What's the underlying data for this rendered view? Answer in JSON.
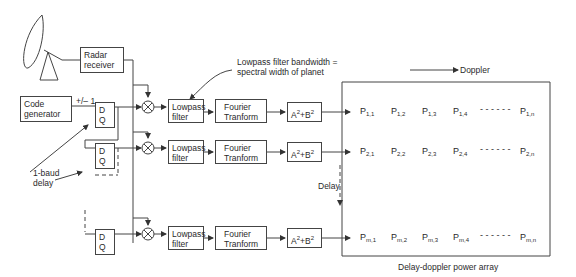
{
  "blocks": {
    "radar_receiver": "Radar receiver",
    "code_generator": "Code generator",
    "plus_minus": "+/– 1",
    "dq": "D Q",
    "lowpass": "Lowpass filter",
    "fourier": "Fourier Tranform",
    "square_sum": {
      "a": "A",
      "b": "B",
      "exp": "2",
      "plus": "+"
    }
  },
  "annotations": {
    "lowpass_note_1": "Lowpass filter bandwidth =",
    "lowpass_note_2": "spectral width of planet",
    "doppler": "Doppler",
    "delay": "Delay",
    "one_baud_1": "1-baud",
    "one_baud_2": "delay",
    "array_caption": "Delay-doppler power array"
  },
  "power_array": {
    "rows": [
      {
        "prefix": "P",
        "cells": [
          "1,1",
          "1,2",
          "1,3",
          "1,4"
        ],
        "last": "1,n"
      },
      {
        "prefix": "P",
        "cells": [
          "2,1",
          "2,2",
          "2,3",
          "2,4"
        ],
        "last": "2,n"
      },
      {
        "prefix": "P",
        "cells": [
          "m,1",
          "m,2",
          "m,3",
          "m,4"
        ],
        "last": "m,n"
      }
    ],
    "ellipsis": "- - - - - -"
  }
}
